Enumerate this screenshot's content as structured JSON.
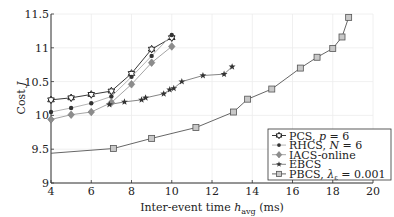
{
  "chart_data": {
    "type": "line",
    "title": "",
    "xlabel": "Inter-event time h_avg (ms)",
    "xlabel_parts": {
      "main": "Inter-event time ",
      "var": "h",
      "sub": "avg",
      "unit": " (ms)"
    },
    "ylabel": "Cost  J",
    "ylabel_parts": {
      "main": "Cost",
      "var": "J"
    },
    "xlim": [
      4,
      20
    ],
    "ylim": [
      9,
      11.5
    ],
    "x_ticks": [
      4,
      6,
      8,
      10,
      12,
      14,
      16,
      18,
      20
    ],
    "x_tick_labels": [
      "4",
      "6",
      "8",
      "10",
      "12",
      "14",
      "16",
      "18",
      "20"
    ],
    "y_ticks": [
      9,
      9.5,
      10,
      10.5,
      11,
      11.5
    ],
    "y_tick_labels": [
      "9",
      "9.5",
      "10",
      "10.5",
      "11",
      "11.5"
    ],
    "grid": true,
    "legend_position": "lower right",
    "series": [
      {
        "name": "PCS, p = 6",
        "legend": {
          "main": "PCS, ",
          "var": "p",
          "rest": " = 6"
        },
        "marker": "hexagram",
        "color": "#222222",
        "line_color": "#222222",
        "x": [
          4,
          5,
          6,
          7,
          8,
          9,
          10
        ],
        "y": [
          10.23,
          10.26,
          10.31,
          10.36,
          10.62,
          10.98,
          11.15
        ]
      },
      {
        "name": "RHCS, N = 6",
        "legend": {
          "main": "RHCS, ",
          "var": "N",
          "rest": " = 6"
        },
        "marker": "dot",
        "color": "#333333",
        "line_color": "#aaaaaa",
        "x": [
          4,
          5,
          6,
          7,
          8,
          9,
          10
        ],
        "y": [
          10.05,
          10.11,
          10.18,
          10.28,
          10.57,
          10.88,
          11.19
        ]
      },
      {
        "name": "IACS-online",
        "legend": {
          "main": "IACS-online",
          "var": "",
          "rest": ""
        },
        "marker": "diamond",
        "color": "#8c8c8c",
        "line_color": "#9a9a9a",
        "x": [
          4,
          5,
          6,
          7,
          8,
          9,
          10
        ],
        "y": [
          9.94,
          10.01,
          10.05,
          10.19,
          10.46,
          10.78,
          11.02
        ]
      },
      {
        "name": "EBCS",
        "legend": {
          "main": "EBCS",
          "var": "",
          "rest": ""
        },
        "marker": "star",
        "color": "#333333",
        "line_color": "#777777",
        "x": [
          6.9,
          7.65,
          8.5,
          8.7,
          9.6,
          9.9,
          10.1,
          10.5,
          11.55,
          12.6,
          13.0
        ],
        "y": [
          10.16,
          10.2,
          10.23,
          10.26,
          10.32,
          10.38,
          10.4,
          10.5,
          10.59,
          10.61,
          10.72
        ]
      },
      {
        "name": "PBCS, λ_ε = 0.001",
        "legend": {
          "main": "PBCS, ",
          "var": "λ",
          "sub": "ε",
          "rest": " = 0.001"
        },
        "marker": "square",
        "color": "#999999",
        "line_color": "#555555",
        "x": [
          4,
          7.1,
          9.0,
          11.2,
          13.07,
          13.77,
          14.97,
          16.39,
          17.22,
          18.0,
          18.46,
          18.79
        ],
        "y": [
          9.44,
          9.51,
          9.66,
          9.82,
          10.05,
          10.24,
          10.39,
          10.7,
          10.86,
          10.99,
          11.16,
          11.45
        ],
        "marker_skip_first": true
      }
    ]
  }
}
